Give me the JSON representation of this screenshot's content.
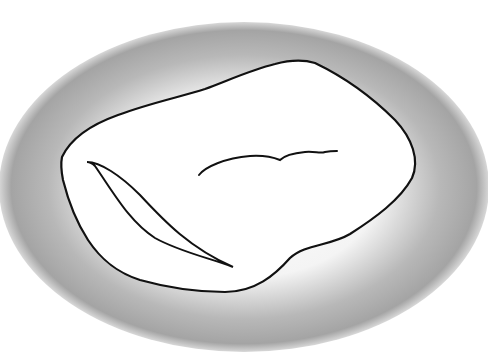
{
  "figure": {
    "colors": {
      "background": "#ffffff",
      "vignette_outer": "#9a9a9a",
      "vignette_inner": "#ffffff",
      "stroke": "#111111"
    }
  }
}
